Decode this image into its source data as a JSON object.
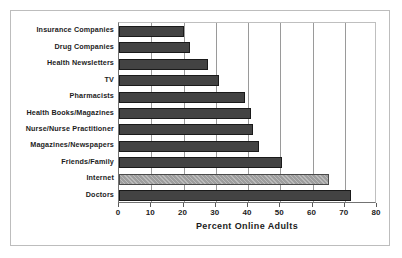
{
  "chart_data": {
    "type": "bar",
    "orientation": "horizontal",
    "title": "",
    "subtitle": "",
    "xlabel": "Percent Online Adults",
    "ylabel": "",
    "xlim": [
      0,
      80
    ],
    "xticks": [
      0,
      10,
      20,
      30,
      40,
      50,
      60,
      70,
      80
    ],
    "xtick_labels": [
      "0",
      "10",
      "20",
      "30",
      "40",
      "50",
      "60",
      "70",
      "80"
    ],
    "grid": "vertical",
    "legend": "none",
    "categories": [
      "Insurance Companies",
      "Drug Companies",
      "Health Newsletters",
      "TV",
      "Pharmacists",
      "Health Books/Magazines",
      "Nurse/Nurse Practitioner",
      "Magazines/Newspapers",
      "Friends/Family",
      "Internet",
      "Doctors"
    ],
    "values": [
      20,
      22,
      27.5,
      31,
      39,
      41,
      41.5,
      43.5,
      50.5,
      65,
      72
    ],
    "highlight_category": "Internet",
    "colors": {
      "bar": "#434343",
      "bar_edge": "#1a1a1a",
      "highlight_bar": "#9e9e9e",
      "gridline": "#9a9a9a",
      "axis": "#737373",
      "text": "#1c1c1c",
      "background": "#ffffff",
      "frame": "#bdbdbd"
    }
  }
}
